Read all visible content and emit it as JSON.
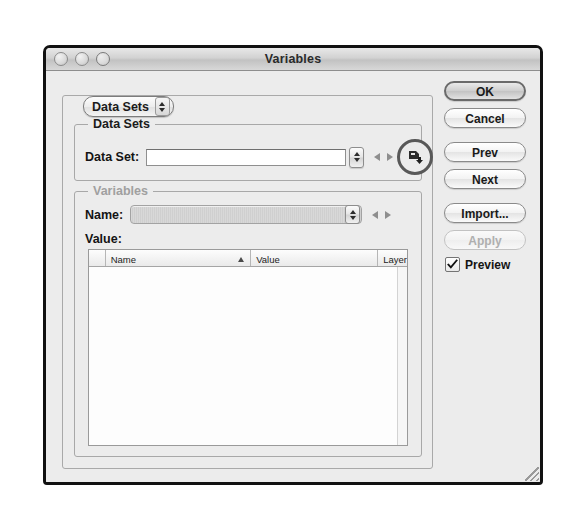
{
  "window": {
    "title": "Variables",
    "traffic_lights": [
      "close-button",
      "minimize-button",
      "zoom-button"
    ]
  },
  "panel_popup": {
    "label": "Data Sets",
    "stepper_icon": "up-down-arrows-icon"
  },
  "data_sets_group": {
    "title": "Data Sets",
    "data_set_label": "Data Set:",
    "data_set_value": "",
    "data_set_placeholder": "",
    "stepper_icon": "up-down-arrows-icon",
    "prev_arrow_icon": "triangle-left-icon",
    "next_arrow_icon": "triangle-right-icon",
    "action_icon": "new-data-set-icon"
  },
  "variables_group": {
    "title": "Variables",
    "name_label": "Name:",
    "name_value": "",
    "value_label": "Value:",
    "value_text": "",
    "stepper_icon": "up-down-arrows-icon",
    "prev_arrow_icon": "triangle-left-icon",
    "next_arrow_icon": "triangle-right-icon"
  },
  "table": {
    "columns": [
      "Name",
      "Value",
      "Layer"
    ],
    "sort_column": "Name",
    "sort_direction": "ascending",
    "sort_icon": "sort-ascending-triangle-icon",
    "rows": []
  },
  "buttons": {
    "ok": "OK",
    "cancel": "Cancel",
    "prev": "Prev",
    "next": "Next",
    "import": "Import...",
    "apply": "Apply"
  },
  "preview": {
    "label": "Preview",
    "checked": true,
    "check_icon": "checkmark-icon"
  }
}
